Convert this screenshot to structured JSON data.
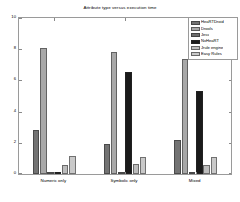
{
  "chart_data": {
    "type": "bar",
    "title": "Attribute type versus execution time",
    "xlabel": "",
    "ylabel": "",
    "ylim": [
      0,
      10
    ],
    "yticks": [
      "0",
      "2",
      "4",
      "6",
      "8",
      "10"
    ],
    "ytick_values": [
      0,
      2,
      4,
      6,
      8,
      10
    ],
    "grid": false,
    "legend_position": "top-right",
    "categories": [
      "Numeric only",
      "Symbolic only",
      "Mixed"
    ],
    "series": [
      {
        "name": "HeaRTDroid",
        "color": "#737373",
        "values": [
          2.85,
          1.95,
          2.2
        ]
      },
      {
        "name": "Drools",
        "color": "#a8a8a8",
        "values": [
          8.1,
          7.8,
          7.35
        ]
      },
      {
        "name": "Jess",
        "color": "#6e6e6e",
        "values": [
          0.12,
          0.16,
          0.1
        ]
      },
      {
        "name": "NxHeaRT",
        "color": "#1a1a1a",
        "values": [
          0.05,
          6.55,
          5.3
        ]
      },
      {
        "name": "Jrule engine",
        "color": "#bdbdbd",
        "values": [
          0.6,
          0.65,
          0.58
        ]
      },
      {
        "name": "Easy Rules",
        "color": "#c9c9c9",
        "values": [
          1.15,
          1.1,
          1.12
        ]
      }
    ]
  },
  "legend": {
    "items": [
      {
        "label": "HeaRTDroid"
      },
      {
        "label": "Drools"
      },
      {
        "label": "Jess"
      },
      {
        "label": "NxHeaRT"
      },
      {
        "label": "Jrule engine"
      },
      {
        "label": "Easy Rules"
      }
    ]
  }
}
